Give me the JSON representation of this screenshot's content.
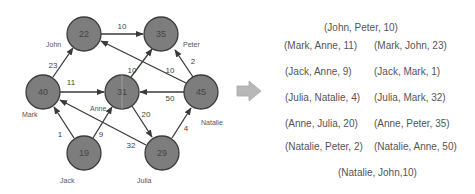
{
  "graph": {
    "nodes": [
      {
        "id": "John",
        "value": "22",
        "label": "John"
      },
      {
        "id": "Peter",
        "value": "35",
        "label": "Peter"
      },
      {
        "id": "Mark",
        "value": "40",
        "label": "Mark"
      },
      {
        "id": "Anne",
        "value": "31",
        "label": "Anne"
      },
      {
        "id": "Natalie",
        "value": "45",
        "label": "Natalie"
      },
      {
        "id": "Jack",
        "value": "19",
        "label": "Jack"
      },
      {
        "id": "Julia",
        "value": "29",
        "label": "Julia"
      }
    ],
    "edges": [
      {
        "from": "John",
        "to": "Peter",
        "weight": "10"
      },
      {
        "from": "Mark",
        "to": "John",
        "weight": "23"
      },
      {
        "from": "Mark",
        "to": "Anne",
        "weight": "11"
      },
      {
        "from": "Anne",
        "to": "Peter",
        "weight": "10"
      },
      {
        "from": "Natalie",
        "to": "John",
        "weight": "10"
      },
      {
        "from": "Natalie",
        "to": "Peter",
        "weight": "2"
      },
      {
        "from": "Natalie",
        "to": "Anne",
        "weight": "50"
      },
      {
        "from": "Anne",
        "to": "Julia",
        "weight": "20"
      },
      {
        "from": "Julia",
        "to": "Natalie",
        "weight": "4"
      },
      {
        "from": "Julia",
        "to": "Mark",
        "weight": "32"
      },
      {
        "from": "Jack",
        "to": "Mark",
        "weight": "1"
      },
      {
        "from": "Jack",
        "to": "Anne",
        "weight": "9"
      }
    ]
  },
  "tuples": [
    "(John, Peter, 10)",
    "(Mark, Anne, 11)",
    "(Mark, John, 23)",
    "(Jack, Anne, 9)",
    "(Jack, Mark, 1)",
    "(Julia, Natalie, 4)",
    "(Julia, Mark, 32)",
    "(Anne, Julia, 20)",
    "(Anne, Peter, 35)",
    "(Natalie, Peter, 2)",
    "(Natalie,  Anne, 50)",
    "(Natalie, John,10)"
  ],
  "colors": {
    "node_fill": "#7d7d7d",
    "node_stroke": "#3d3d3d",
    "edge": "#3a3a3a",
    "arrow_fill": "#b8b8b8"
  }
}
